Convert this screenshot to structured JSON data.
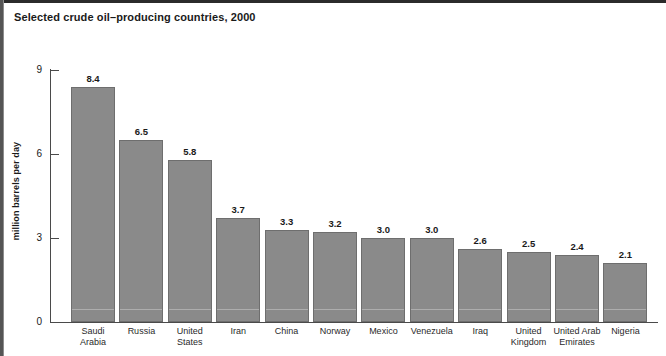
{
  "title": "Selected crude oil–producing countries, 2000",
  "chart_data": {
    "type": "bar",
    "title": "Selected crude oil–producing countries, 2000",
    "xlabel": "",
    "ylabel": "million barrels per day",
    "ylim": [
      0,
      9
    ],
    "yticks": [
      "0",
      "3",
      "6",
      "9"
    ],
    "ytick_values": [
      0,
      3,
      6,
      9
    ],
    "grid": false,
    "legend": "none",
    "bar_color": "#8a8a8a",
    "bar_edge_color": "#6e6e6e",
    "categories": [
      "Saudi Arabia",
      "Russia",
      "United States",
      "Iran",
      "China",
      "Norway",
      "Mexico",
      "Venezuela",
      "Iraq",
      "United Kingdom",
      "United Arab Emirates",
      "Nigeria"
    ],
    "category_lines": [
      [
        "Saudi",
        "Arabia"
      ],
      [
        "Russia"
      ],
      [
        "United",
        "States"
      ],
      [
        "Iran"
      ],
      [
        "China"
      ],
      [
        "Norway"
      ],
      [
        "Mexico"
      ],
      [
        "Venezuela"
      ],
      [
        "Iraq"
      ],
      [
        "United",
        "Kingdom"
      ],
      [
        "United Arab",
        "Emirates"
      ],
      [
        "Nigeria"
      ]
    ],
    "values": [
      8.4,
      6.5,
      5.8,
      3.7,
      3.3,
      3.2,
      3.0,
      3.0,
      2.6,
      2.5,
      2.4,
      2.1
    ],
    "value_labels": [
      "8.4",
      "6.5",
      "5.8",
      "3.7",
      "3.3",
      "3.2",
      "3.0",
      "3.0",
      "2.6",
      "2.5",
      "2.4",
      "2.1"
    ]
  }
}
